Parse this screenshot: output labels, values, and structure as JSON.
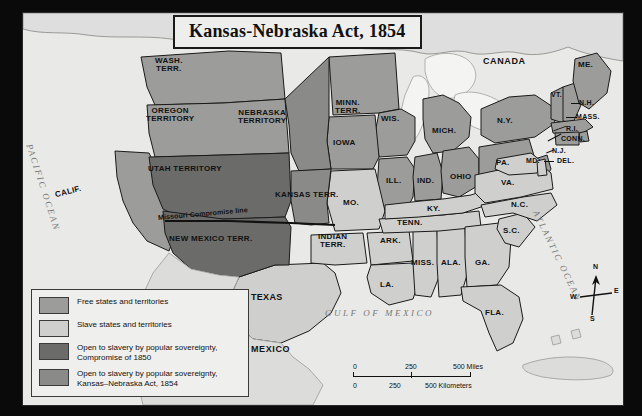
{
  "map": {
    "title": "Kansas-Nebraska Act, 1854",
    "countries": [
      {
        "name": "canada",
        "label": "CANADA"
      },
      {
        "name": "mexico",
        "label": "MEXICO"
      }
    ],
    "oceans": [
      {
        "name": "pacific-ocean",
        "label": "PACIFIC OCEAN"
      },
      {
        "name": "atlantic-ocean",
        "label": "ATLANTIC OCEAN"
      },
      {
        "name": "gulf-of-mexico",
        "label": "GULF OF MEXICO"
      }
    ],
    "annotations": [
      {
        "name": "missouri-compromise-line",
        "label": "Missouri Compromise line"
      }
    ],
    "regions": [
      {
        "name": "wash-terr",
        "label": "WASH.\nTERR.",
        "line1": "WASH.",
        "line2": "TERR.",
        "category": "free"
      },
      {
        "name": "oregon-territory",
        "line1": "OREGON",
        "line2": "TERRITORY",
        "category": "free"
      },
      {
        "name": "utah-territory",
        "line1": "UTAH TERRITORY",
        "line2": "",
        "category": "compromise-1850"
      },
      {
        "name": "new-mexico-terr",
        "line1": "NEW MEXICO TERR.",
        "line2": "",
        "category": "compromise-1850"
      },
      {
        "name": "california",
        "line1": "CALIF.",
        "line2": "",
        "category": "free"
      },
      {
        "name": "nebraska-territory",
        "line1": "NEBRASKA",
        "line2": "TERRITORY",
        "category": "kansas-nebraska-1854"
      },
      {
        "name": "kansas-terr",
        "line1": "KANSAS  TERR.",
        "line2": "",
        "category": "kansas-nebraska-1854"
      },
      {
        "name": "minn-terr",
        "line1": "MINN.",
        "line2": "TERR.",
        "category": "free"
      },
      {
        "name": "indian-terr",
        "line1": "INDIAN",
        "line2": "TERR.",
        "category": "slave"
      },
      {
        "name": "wisconsin",
        "line1": "WIS.",
        "line2": "",
        "category": "free"
      },
      {
        "name": "iowa",
        "line1": "IOWA",
        "line2": "",
        "category": "free"
      },
      {
        "name": "michigan",
        "line1": "MICH.",
        "line2": "",
        "category": "free"
      },
      {
        "name": "illinois",
        "line1": "ILL.",
        "line2": "",
        "category": "free"
      },
      {
        "name": "indiana",
        "line1": "IND.",
        "line2": "",
        "category": "free"
      },
      {
        "name": "ohio",
        "line1": "OHIO",
        "line2": "",
        "category": "free"
      },
      {
        "name": "missouri",
        "line1": "MO.",
        "line2": "",
        "category": "slave"
      },
      {
        "name": "kentucky",
        "line1": "KY.",
        "line2": "",
        "category": "slave"
      },
      {
        "name": "tennessee",
        "line1": "TENN.",
        "line2": "",
        "category": "slave"
      },
      {
        "name": "arkansas",
        "line1": "ARK.",
        "line2": "",
        "category": "slave"
      },
      {
        "name": "texas",
        "line1": "TEXAS",
        "line2": "",
        "category": "slave"
      },
      {
        "name": "louisiana",
        "line1": "LA.",
        "line2": "",
        "category": "slave"
      },
      {
        "name": "mississippi",
        "line1": "MISS.",
        "line2": "",
        "category": "slave"
      },
      {
        "name": "alabama",
        "line1": "ALA.",
        "line2": "",
        "category": "slave"
      },
      {
        "name": "georgia",
        "line1": "GA.",
        "line2": "",
        "category": "slave"
      },
      {
        "name": "florida",
        "line1": "FLA.",
        "line2": "",
        "category": "slave"
      },
      {
        "name": "south-carolina",
        "line1": "S.C.",
        "line2": "",
        "category": "slave"
      },
      {
        "name": "north-carolina",
        "line1": "N.C.",
        "line2": "",
        "category": "slave"
      },
      {
        "name": "virginia",
        "line1": "VA.",
        "line2": "",
        "category": "slave"
      },
      {
        "name": "maryland",
        "line1": "MD.",
        "line2": "",
        "category": "slave"
      },
      {
        "name": "delaware",
        "line1": "DEL.",
        "line2": "",
        "category": "slave"
      },
      {
        "name": "pennsylvania",
        "line1": "PA.",
        "line2": "",
        "category": "free"
      },
      {
        "name": "new-jersey",
        "line1": "N.J.",
        "line2": "",
        "category": "free"
      },
      {
        "name": "new-york",
        "line1": "N.Y.",
        "line2": "",
        "category": "free"
      },
      {
        "name": "connecticut",
        "line1": "CONN.",
        "line2": "",
        "category": "free"
      },
      {
        "name": "rhode-island",
        "line1": "R.I.",
        "line2": "",
        "category": "free"
      },
      {
        "name": "massachusetts",
        "line1": "MASS.",
        "line2": "",
        "category": "free"
      },
      {
        "name": "vermont",
        "line1": "VT.",
        "line2": "",
        "category": "free"
      },
      {
        "name": "new-hampshire",
        "line1": "N.H.",
        "line2": "",
        "category": "free"
      },
      {
        "name": "maine",
        "line1": "ME.",
        "line2": "",
        "category": "free"
      }
    ]
  },
  "legend": {
    "items": [
      {
        "name": "free-states",
        "color": "#9c9c9a",
        "line1": "Free states and territories",
        "line2": ""
      },
      {
        "name": "slave-states",
        "color": "#cfcfcd",
        "line1": "Slave states and territories",
        "line2": ""
      },
      {
        "name": "compromise-1850",
        "color": "#6b6b69",
        "line1": "Open to slavery by popular sovereignty,",
        "line2": "Compromise of 1850"
      },
      {
        "name": "kansas-nebraska-1854",
        "color": "#8a8a88",
        "line1": "Open to slavery by popular sovereignty,",
        "line2": "Kansas–Nebraska Act, 1854"
      }
    ]
  },
  "scale": {
    "miles": {
      "ticks": [
        "0",
        "250",
        "500"
      ],
      "unit": "500 Miles",
      "label_mid": "250",
      "label_zero": "0"
    },
    "kilometers": {
      "ticks": [
        "0",
        "250",
        "500"
      ],
      "unit": "500 Kilometers",
      "label_mid": "250",
      "label_zero": "0"
    }
  },
  "compass": {
    "north": "N",
    "east": "E",
    "south": "S",
    "west": "W"
  },
  "colors": {
    "free": "#9c9c9a",
    "slave": "#cfcfcd",
    "compromise_1850": "#6b6b69",
    "kansas_nebraska_1854": "#8a8a88",
    "water": "#efefee",
    "background": "#e9e9e7",
    "outline": "#1a1a1a",
    "frame": "#0a0a0a"
  }
}
